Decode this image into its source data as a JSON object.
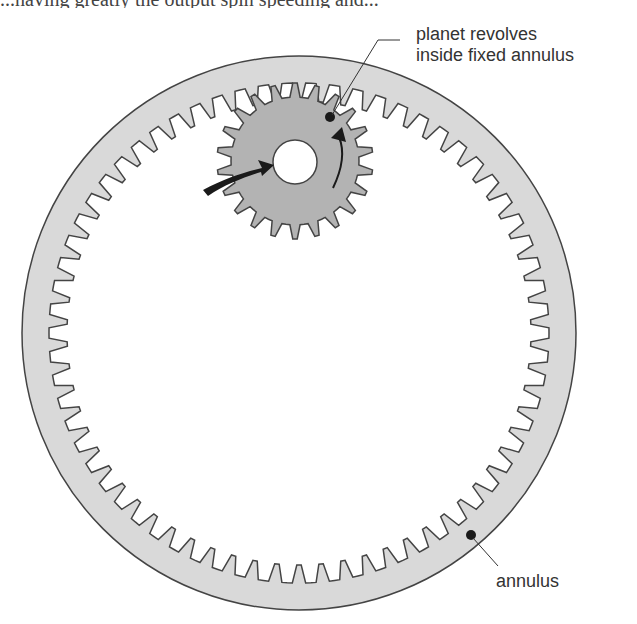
{
  "top_text_fragment": "...having greatly the output spin speeding and...",
  "labels": {
    "planet_line1": "planet revolves",
    "planet_line2": "inside fixed annulus",
    "annulus": "annulus"
  },
  "annulus": {
    "center": [
      299,
      333
    ],
    "outer_radius": 277,
    "tooth_tip_radius": 232,
    "tooth_root_radius": 250,
    "teeth": 66,
    "fill": "#d9d9d9",
    "stroke": "#444444"
  },
  "planet": {
    "center": [
      295,
      161
    ],
    "tip_radius": 78,
    "root_radius": 64,
    "hole_radius": 22,
    "teeth": 22,
    "fill": "#b3b3b3",
    "stroke": "#444444"
  },
  "markers": {
    "planet_dot": [
      330,
      117
    ],
    "annulus_dot": [
      471,
      535
    ]
  },
  "colors": {
    "arrow": "#1a1a1a",
    "text": "#333333",
    "background": "#ffffff"
  }
}
